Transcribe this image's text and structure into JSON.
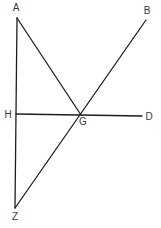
{
  "diagram": {
    "type": "geometric-figure",
    "points": {
      "A": {
        "label": "A",
        "x": 17,
        "y": 18,
        "lx": 16,
        "ly": 11
      },
      "B": {
        "label": "B",
        "x": 146,
        "y": 20,
        "lx": 147,
        "ly": 14
      },
      "H": {
        "label": "H",
        "x": 16,
        "y": 114,
        "lx": 8,
        "ly": 118
      },
      "G": {
        "label": "G",
        "x": 81,
        "y": 115,
        "lx": 83,
        "ly": 125
      },
      "D": {
        "label": "D",
        "x": 142,
        "y": 116,
        "lx": 149,
        "ly": 120
      },
      "Z": {
        "label": "Z",
        "x": 15,
        "y": 208,
        "lx": 15,
        "ly": 220
      }
    },
    "segments": [
      {
        "name": "AZ",
        "from": "A",
        "to": "Z"
      },
      {
        "name": "AG",
        "from": "A",
        "to": "G"
      },
      {
        "name": "ZB",
        "from": "Z",
        "to": "B"
      },
      {
        "name": "HD",
        "from": "H",
        "to": "D"
      }
    ],
    "line_color": "#1e1e1e",
    "label_color": "#3a3a3a"
  }
}
